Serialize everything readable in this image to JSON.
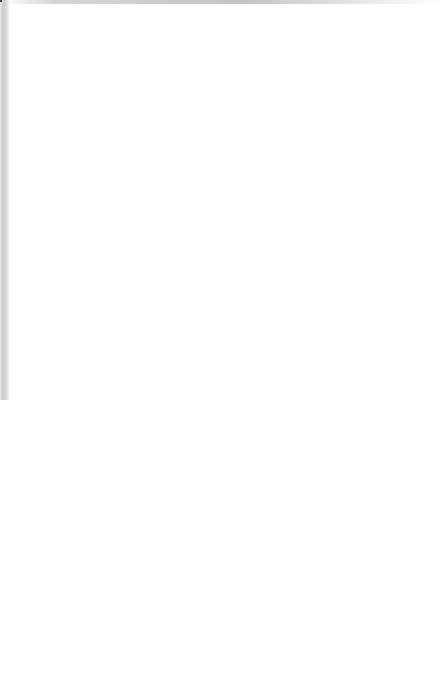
{
  "chart_data": {
    "type": "line",
    "title": "",
    "xlabel": "Concentration (mg l⁻¹)",
    "ylabel": "% mortality",
    "x_scale": "log",
    "y_scale": "probit",
    "xlim": [
      1,
      100
    ],
    "ylim": [
      0.05,
      99.5
    ],
    "grid": true,
    "grid_style": "log-probit graph paper, fine blue-grey ruling",
    "legend": "inline curve numbers 1-5",
    "xticks": [
      1,
      2,
      3,
      4,
      5,
      6,
      7,
      8,
      10,
      20,
      30,
      40,
      50,
      60,
      80,
      100
    ],
    "xtick_labels": [
      "1",
      "2",
      "3",
      "4",
      "5",
      "6",
      "7",
      "8",
      "10",
      "20",
      "30",
      "40",
      "50",
      "60",
      "80",
      "100"
    ],
    "yticks": [
      0.1,
      0.2,
      0.5,
      1,
      2,
      5,
      10,
      20,
      30,
      40,
      50,
      60,
      70,
      80,
      90,
      95,
      98,
      99
    ],
    "ytick_labels": [
      "0.1",
      "0.2",
      "0.5",
      "1",
      "2",
      "5",
      "10",
      "20",
      "30",
      "40",
      "50",
      "60",
      "70",
      "80",
      "90",
      "95",
      "98",
      "99"
    ],
    "series": [
      {
        "name": "1",
        "label": "1",
        "marker": "filled-circle",
        "color": "#111111",
        "points": [
          {
            "x": 5.0,
            "y": 13.0
          },
          {
            "x": 10.0,
            "y": 30.0
          },
          {
            "x": 20.0,
            "y": 56.0
          },
          {
            "x": 30.0,
            "y": 72.0
          },
          {
            "x": 50.0,
            "y": 85.0
          },
          {
            "x": 80.0,
            "y": 94.0
          }
        ]
      },
      {
        "name": "2",
        "label": "2",
        "marker": "open-circle",
        "color": "#111111",
        "points": [
          {
            "x": 5.0,
            "y": 4.0
          },
          {
            "x": 10.0,
            "y": 51.0
          },
          {
            "x": 20.0,
            "y": 88.0
          },
          {
            "x": 30.0,
            "y": 97.5
          },
          {
            "x": 50.0,
            "y": 99.3
          }
        ]
      },
      {
        "name": "3",
        "label": "3",
        "marker": "filled-triangle",
        "color": "#111111",
        "points": [
          {
            "x": 4.5,
            "y": 22.0
          },
          {
            "x": 10.0,
            "y": 62.0
          },
          {
            "x": 20.0,
            "y": 86.0
          },
          {
            "x": 30.0,
            "y": 94.0
          },
          {
            "x": 50.0,
            "y": 99.0
          }
        ]
      },
      {
        "name": "4",
        "label": "4",
        "marker": "filled-square",
        "color": "#111111",
        "points": [
          {
            "x": 5.0,
            "y": 2.1
          },
          {
            "x": 10.0,
            "y": 4.4
          },
          {
            "x": 20.0,
            "y": 30.0
          },
          {
            "x": 30.0,
            "y": 57.0
          },
          {
            "x": 60.0,
            "y": 84.0
          }
        ]
      },
      {
        "name": "5",
        "label": "5",
        "marker": "open-square",
        "color": "#111111",
        "points": [
          {
            "x": 10.0,
            "y": 1.0
          },
          {
            "x": 30.0,
            "y": 5.0
          },
          {
            "x": 50.0,
            "y": 24.0
          },
          {
            "x": 95.0,
            "y": 49.0
          }
        ]
      }
    ],
    "curve_tag_positions": [
      {
        "label": "1",
        "x": 44.0,
        "y": 89.5
      },
      {
        "label": "2",
        "x": 17.5,
        "y": 97.5
      },
      {
        "label": "3",
        "x": 26.0,
        "y": 95.5
      },
      {
        "label": "4",
        "x": 68.0,
        "y": 75.0
      },
      {
        "label": "5",
        "x": 66.0,
        "y": 34.0
      }
    ]
  }
}
